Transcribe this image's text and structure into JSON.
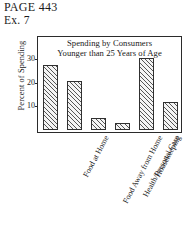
{
  "header": {
    "page_label": "PAGE 443",
    "exercise_label": "Ex. 7"
  },
  "chart_data": {
    "type": "bar",
    "title": "Spending by Consumers Younger than 25 Years of Age",
    "title_line1": "Spending by Consumers",
    "title_line2": "Younger than 25 Years of Age",
    "xlabel": "",
    "ylabel": "Percent of Spending",
    "categories": [
      "Food at Home",
      "Food Away from Home",
      "Health/Personal Care",
      "Housekeeping",
      "Transportation/Utilities",
      "Other"
    ],
    "values": [
      28,
      21,
      5,
      3,
      31,
      12
    ],
    "ylim": [
      0,
      40
    ],
    "yticks": [
      10,
      20,
      30
    ],
    "ytick_labels": [
      "10",
      "20",
      "30"
    ],
    "grid": false,
    "legend": "none",
    "bar_fill": "#f4f4f4",
    "bar_hatch": "diagonal",
    "bar_edge_color": "#303030",
    "frame_color": "#2b2b2b"
  }
}
